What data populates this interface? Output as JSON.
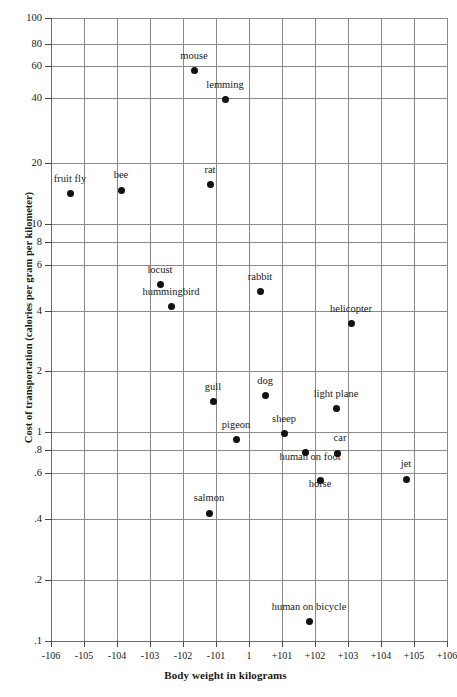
{
  "chart_data": {
    "type": "scatter",
    "title": "",
    "xlabel": "Body weight in kilograms",
    "ylabel": "Cost of transportation (calories per gram per kilometer)",
    "xscale": "log",
    "yscale": "log",
    "grid": true,
    "legend": "none",
    "xlim": [
      -1000000,
      1000000
    ],
    "ylim": [
      0.1,
      100
    ],
    "xticklabels": [
      "-106",
      "-105",
      "-104",
      "-103",
      "-102",
      "-101",
      "1",
      "+101",
      "+102",
      "+103",
      "+104",
      "+105",
      "+106"
    ],
    "yticklabels": [
      "100",
      "80",
      "60",
      "40",
      "20",
      "10",
      "8",
      "6",
      "4",
      "2",
      "1",
      ".8",
      ".6",
      ".4",
      ".2",
      ".1"
    ],
    "yticks": [
      100,
      80,
      60,
      40,
      20,
      10,
      8,
      6,
      4,
      2,
      1,
      0.8,
      0.6,
      0.4,
      0.2,
      0.1
    ],
    "points": [
      {
        "label": "fruit fly",
        "x": "-10^5.4",
        "y": 14.5,
        "px": 70,
        "py": 193,
        "lx": 70,
        "ly": 184
      },
      {
        "label": "bee",
        "x": "-10^4.0",
        "y": 15.0,
        "px": 121,
        "py": 190,
        "lx": 121,
        "ly": 180
      },
      {
        "label": "mouse",
        "x": "-10^2.3",
        "y": 60.0,
        "px": 194,
        "py": 70,
        "lx": 194,
        "ly": 61
      },
      {
        "label": "lemming",
        "x": "-10^1.4",
        "y": 42.0,
        "px": 225,
        "py": 99,
        "lx": 225,
        "ly": 90
      },
      {
        "label": "rat",
        "x": "-10^0.9",
        "y": 16.0,
        "px": 210,
        "py": 184,
        "lx": 210,
        "ly": 175
      },
      {
        "label": "locust",
        "x": "-10^1.7",
        "y": 5.4,
        "px": 160,
        "py": 284,
        "lx": 160,
        "ly": 275
      },
      {
        "label": "hummingbird",
        "x": "-10^1.4",
        "y": 4.2,
        "px": 171,
        "py": 306,
        "lx": 171,
        "ly": 297
      },
      {
        "label": "rabbit",
        "x": "+10^0.3",
        "y": 5.0,
        "px": 260,
        "py": 291,
        "lx": 260,
        "ly": 282
      },
      {
        "label": "helicopter",
        "x": "+10^3.2",
        "y": 3.6,
        "px": 351,
        "py": 323,
        "lx": 351,
        "ly": 314
      },
      {
        "label": "gull",
        "x": "-10^0.9",
        "y": 1.5,
        "px": 213,
        "py": 401,
        "lx": 213,
        "ly": 392
      },
      {
        "label": "dog",
        "x": "+10^0.6",
        "y": 1.65,
        "px": 265,
        "py": 395,
        "lx": 265,
        "ly": 386
      },
      {
        "label": "light plane",
        "x": "+10^2.7",
        "y": 1.35,
        "px": 336,
        "py": 408,
        "lx": 336,
        "ly": 399
      },
      {
        "label": "pigeon",
        "x": "-10^0.2",
        "y": 0.94,
        "px": 236,
        "py": 439,
        "lx": 236,
        "ly": 430
      },
      {
        "label": "sheep",
        "x": "+10^1.2",
        "y": 1.08,
        "px": 284,
        "py": 433,
        "lx": 284,
        "ly": 424
      },
      {
        "label": "human on foot",
        "x": "+10^1.8",
        "y": 0.78,
        "px": 305,
        "py": 452,
        "lx": 310,
        "ly": 462
      },
      {
        "label": "car",
        "x": "+10^2.8",
        "y": 0.77,
        "px": 337,
        "py": 453,
        "lx": 340,
        "ly": 443
      },
      {
        "label": "horse",
        "x": "+10^2.3",
        "y": 0.6,
        "px": 320,
        "py": 480,
        "lx": 320,
        "ly": 489
      },
      {
        "label": "jet",
        "x": "+10^4.9",
        "y": 0.61,
        "px": 406,
        "py": 479,
        "lx": 406,
        "ly": 469
      },
      {
        "label": "salmon",
        "x": "-10^0.9",
        "y": 0.42,
        "px": 209,
        "py": 513,
        "lx": 209,
        "ly": 503
      },
      {
        "label": "human on bicycle",
        "x": "+10^1.9",
        "y": 0.135,
        "px": 309,
        "py": 621,
        "lx": 309,
        "ly": 612
      }
    ]
  },
  "axes": {
    "x_gridlines_px": [
      51,
      84,
      117,
      150,
      183,
      216,
      249,
      282,
      315,
      348,
      381,
      414,
      447
    ],
    "y_gridlines_px": [
      18,
      44,
      66,
      98,
      163,
      224,
      242,
      265,
      311,
      371,
      432,
      450,
      473,
      519,
      580,
      641
    ]
  }
}
